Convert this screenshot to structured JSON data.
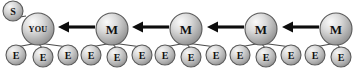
{
  "diagram": {
    "type": "node-link-chain",
    "canvas": {
      "width": 361,
      "height": 78
    },
    "colors": {
      "node_fill_light": "#f2f2f2",
      "node_fill_mid": "#bdbdbd",
      "node_fill_dark": "#8a8a8a",
      "node_stroke": "#5a5a5a",
      "edge": "#4a4a4a",
      "arrow": "#0d0d0d",
      "label": "#111111",
      "background": "#ffffff"
    },
    "labels": {
      "sender": "S",
      "you": "YOU",
      "middle": "M",
      "end": "E"
    },
    "major_nodes": [
      {
        "id": "you",
        "label": "YOU",
        "cx": 38,
        "cy": 29,
        "r": 16,
        "label_class": "lbl-you"
      },
      {
        "id": "m1",
        "label": "M",
        "cx": 112,
        "cy": 29,
        "r": 16,
        "label_class": "lbl-major"
      },
      {
        "id": "m2",
        "label": "M",
        "cx": 186,
        "cy": 29,
        "r": 16,
        "label_class": "lbl-major"
      },
      {
        "id": "m3",
        "label": "M",
        "cx": 261,
        "cy": 29,
        "r": 16,
        "label_class": "lbl-major"
      },
      {
        "id": "m4",
        "label": "M",
        "cx": 336,
        "cy": 29,
        "r": 16,
        "label_class": "lbl-major"
      }
    ],
    "sender_node": {
      "id": "s",
      "label": "S",
      "cx": 13,
      "cy": 11,
      "r": 10
    },
    "minor_nodes": [
      {
        "parent": "you",
        "label": "E",
        "cx": 16,
        "cy": 55,
        "r": 10
      },
      {
        "parent": "you",
        "label": "E",
        "cx": 43,
        "cy": 57,
        "r": 10
      },
      {
        "parent": "you",
        "label": "E",
        "cx": 68,
        "cy": 55,
        "r": 10
      },
      {
        "parent": "m1",
        "label": "E",
        "cx": 91,
        "cy": 55,
        "r": 10
      },
      {
        "parent": "m1",
        "label": "E",
        "cx": 117,
        "cy": 57,
        "r": 10
      },
      {
        "parent": "m1",
        "label": "E",
        "cx": 142,
        "cy": 55,
        "r": 10
      },
      {
        "parent": "m2",
        "label": "E",
        "cx": 165,
        "cy": 55,
        "r": 10
      },
      {
        "parent": "m2",
        "label": "E",
        "cx": 191,
        "cy": 57,
        "r": 10
      },
      {
        "parent": "m2",
        "label": "E",
        "cx": 216,
        "cy": 55,
        "r": 10
      },
      {
        "parent": "m3",
        "label": "E",
        "cx": 240,
        "cy": 55,
        "r": 10
      },
      {
        "parent": "m3",
        "label": "E",
        "cx": 266,
        "cy": 57,
        "r": 10
      },
      {
        "parent": "m3",
        "label": "E",
        "cx": 291,
        "cy": 55,
        "r": 10
      },
      {
        "parent": "m4",
        "label": "E",
        "cx": 315,
        "cy": 55,
        "r": 10
      },
      {
        "parent": "m4",
        "label": "E",
        "cx": 341,
        "cy": 57,
        "r": 10
      }
    ],
    "arrows": [
      {
        "from": "m1",
        "to": "you",
        "x_start": 95,
        "x_end": 58,
        "y": 27
      },
      {
        "from": "m2",
        "to": "m1",
        "x_start": 169,
        "x_end": 132,
        "y": 27
      },
      {
        "from": "m3",
        "to": "m2",
        "x_start": 244,
        "x_end": 207,
        "y": 27
      },
      {
        "from": "m4",
        "to": "m3",
        "x_start": 319,
        "x_end": 282,
        "y": 27
      }
    ]
  }
}
